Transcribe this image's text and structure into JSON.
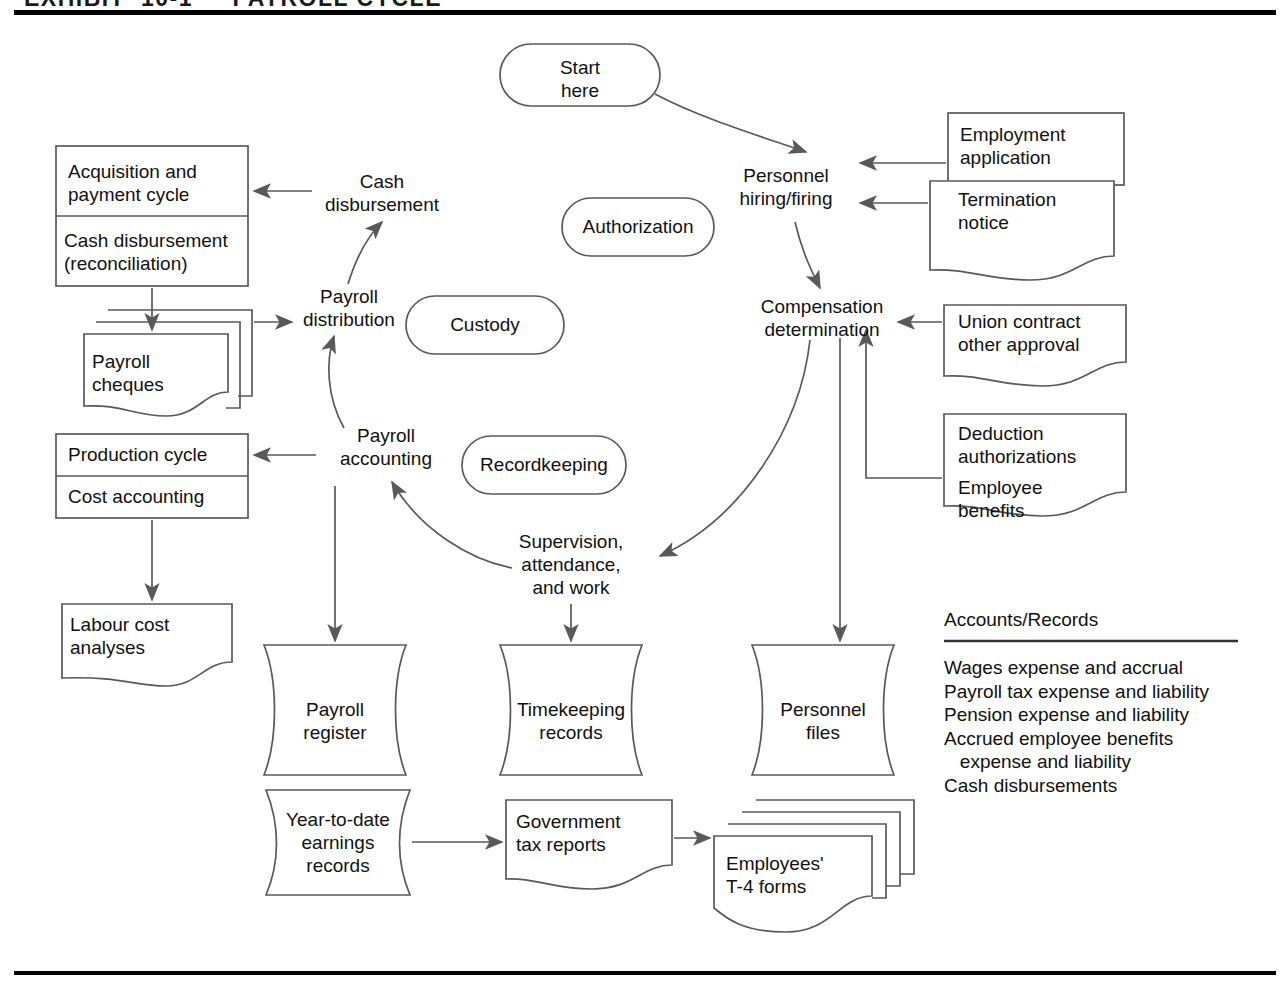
{
  "exhibit": {
    "title_fragment": "EXHIBIT  10-1     PAYROLL CYCLE"
  },
  "flow": {
    "start": "Start\nhere",
    "nodes": {
      "personnel_hiring": "Personnel\nhiring/firing",
      "compensation": "Compensation\ndetermination",
      "supervision": "Supervision,\nattendance,\nand work",
      "payroll_accounting": "Payroll\naccounting",
      "payroll_distribution": "Payroll\ndistribution",
      "cash_disbursement": "Cash\ndisbursement"
    }
  },
  "functions": {
    "authorization": "Authorization",
    "custody": "Custody",
    "recordkeeping": "Recordkeeping"
  },
  "left_cycles": {
    "acquisition_box": {
      "top": "Acquisition and\npayment cycle",
      "bottom": "Cash disbursement\n(reconciliation)"
    },
    "production_box": {
      "top": "Production cycle",
      "bottom": "Cost accounting"
    },
    "payroll_cheques": "Payroll\ncheques",
    "labour_cost": "Labour cost\nanalyses"
  },
  "right_documents": {
    "employment_application": "Employment\napplication",
    "termination_notice": "Termination\nnotice",
    "union_contract": "Union contract\nother approval",
    "deduction_authorizations": "Deduction\nauthorizations",
    "employee_benefits": "Employee\nbenefits"
  },
  "records": {
    "payroll_register": "Payroll\nregister",
    "timekeeping_records": "Timekeeping\nrecords",
    "personnel_files": "Personnel\nfiles",
    "ytd_earnings": "Year-to-date\nearnings\nrecords",
    "government_tax_reports": "Government\ntax reports",
    "employees_t4": "Employees'\nT-4 forms"
  },
  "accounts_panel": {
    "heading": "Accounts/Records",
    "items": [
      "Wages expense and accrual",
      "Payroll tax expense and liability",
      "Pension expense and liability",
      "Accrued employee benefits",
      "   expense and liability",
      "Cash disbursements"
    ]
  },
  "style": {
    "stroke": "#595959",
    "ink": "#111111",
    "rule": "#000000"
  }
}
